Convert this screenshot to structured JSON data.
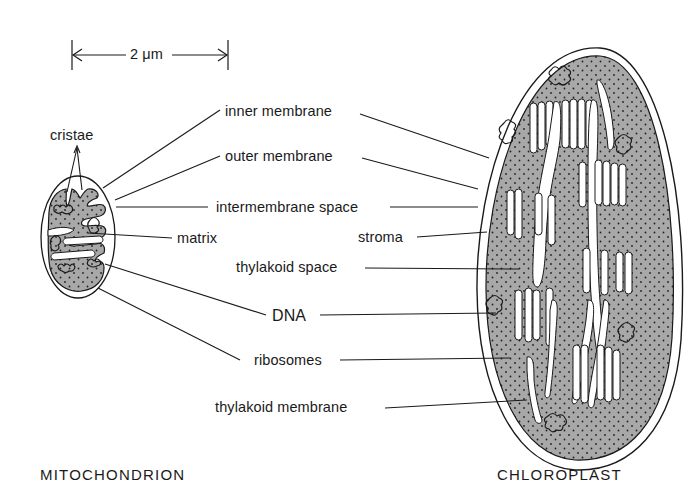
{
  "scale_bar": {
    "label": "2 μm"
  },
  "mitochondrion": {
    "title": "MITOCHONDRION",
    "labels": {
      "cristae": "cristae",
      "matrix": "matrix"
    }
  },
  "chloroplast": {
    "title": "CHLOROPLAST",
    "labels": {
      "stroma": "stroma",
      "thylakoid_space": "thylakoid space",
      "thylakoid_membrane": "thylakoid membrane"
    }
  },
  "shared_labels": {
    "inner_membrane": "inner membrane",
    "outer_membrane": "outer membrane",
    "intermembrane_space": "intermembrane space",
    "dna": "DNA",
    "ribosomes": "ribosomes"
  },
  "colors": {
    "ink": "#1a1a1a",
    "stroma_fill": "#a8a8a8",
    "background": "#ffffff"
  }
}
